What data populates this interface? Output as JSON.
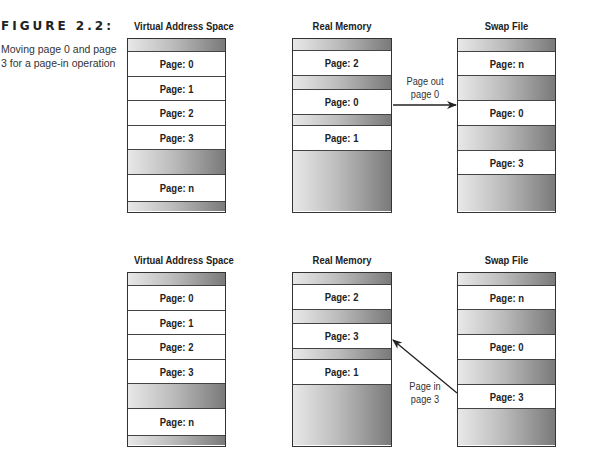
{
  "figure": {
    "label": "FIGURE 2.2:",
    "caption": "Moving page 0 and page 3 for a page-in operation"
  },
  "diagrams": [
    {
      "name": "page-out",
      "columns": [
        {
          "title": "Virtual Address Space",
          "rows": [
            {
              "type": "gray",
              "label": ""
            },
            {
              "type": "page",
              "label": "Page: 0"
            },
            {
              "type": "page",
              "label": "Page: 1"
            },
            {
              "type": "page",
              "label": "Page: 2"
            },
            {
              "type": "page",
              "label": "Page: 3"
            },
            {
              "type": "gray",
              "label": ""
            },
            {
              "type": "page",
              "label": "Page: n"
            },
            {
              "type": "gray",
              "label": ""
            }
          ]
        },
        {
          "title": "Real Memory",
          "rows": [
            {
              "type": "gray",
              "label": ""
            },
            {
              "type": "page",
              "label": "Page: 2"
            },
            {
              "type": "gray",
              "label": ""
            },
            {
              "type": "page",
              "label": "Page: 0"
            },
            {
              "type": "gray",
              "label": ""
            },
            {
              "type": "page",
              "label": "Page: 1"
            },
            {
              "type": "gray",
              "label": ""
            }
          ]
        },
        {
          "title": "Swap File",
          "rows": [
            {
              "type": "gray",
              "label": ""
            },
            {
              "type": "page",
              "label": "Page: n"
            },
            {
              "type": "gray",
              "label": ""
            },
            {
              "type": "page",
              "label": "Page: 0"
            },
            {
              "type": "gray",
              "label": ""
            },
            {
              "type": "page",
              "label": "Page: 3"
            },
            {
              "type": "gray",
              "label": ""
            }
          ]
        }
      ],
      "arrow": {
        "label_line1": "Page out",
        "label_line2": "page 0",
        "from": "Real Memory Page: 0",
        "to": "Swap File Page: 0"
      }
    },
    {
      "name": "page-in",
      "columns": [
        {
          "title": "Virtual Address Space",
          "rows": [
            {
              "type": "gray",
              "label": ""
            },
            {
              "type": "page",
              "label": "Page: 0"
            },
            {
              "type": "page",
              "label": "Page: 1"
            },
            {
              "type": "page",
              "label": "Page: 2"
            },
            {
              "type": "page",
              "label": "Page: 3"
            },
            {
              "type": "gray",
              "label": ""
            },
            {
              "type": "page",
              "label": "Page: n"
            },
            {
              "type": "gray",
              "label": ""
            }
          ]
        },
        {
          "title": "Real Memory",
          "rows": [
            {
              "type": "gray",
              "label": ""
            },
            {
              "type": "page",
              "label": "Page: 2"
            },
            {
              "type": "gray",
              "label": ""
            },
            {
              "type": "page",
              "label": "Page: 3"
            },
            {
              "type": "gray",
              "label": ""
            },
            {
              "type": "page",
              "label": "Page: 1"
            },
            {
              "type": "gray",
              "label": ""
            }
          ]
        },
        {
          "title": "Swap File",
          "rows": [
            {
              "type": "gray",
              "label": ""
            },
            {
              "type": "page",
              "label": "Page: n"
            },
            {
              "type": "gray",
              "label": ""
            },
            {
              "type": "page",
              "label": "Page: 0"
            },
            {
              "type": "gray",
              "label": ""
            },
            {
              "type": "page",
              "label": "Page: 3"
            },
            {
              "type": "gray",
              "label": ""
            }
          ]
        }
      ],
      "arrow": {
        "label_line1": "Page in",
        "label_line2": "page 3",
        "from": "Swap File Page: 3",
        "to": "Real Memory Page: 3"
      }
    }
  ],
  "colors": {
    "border": "#333333",
    "gradient_light": "#e8e8e8",
    "gradient_dark": "#7a7a7a",
    "page_bg": "#ffffff"
  }
}
